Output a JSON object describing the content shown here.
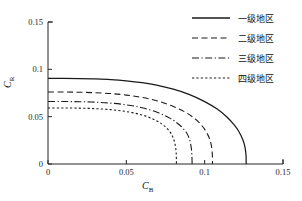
{
  "chart_data": {
    "type": "line",
    "title": "",
    "xlabel": "C_B",
    "xlabel_base": "C",
    "xlabel_sub": "B",
    "ylabel_base": "C",
    "ylabel_sub": "R",
    "xlim": [
      0,
      0.15
    ],
    "ylim": [
      0,
      0.15
    ],
    "xticks": [
      0,
      0.05,
      0.1,
      0.15
    ],
    "xticklabels": [
      "0",
      "0.05",
      "0.1",
      "0.15"
    ],
    "yticks": [
      0,
      0.05,
      0.1,
      0.15
    ],
    "yticklabels": [
      "0",
      "0.05",
      "0.1",
      "0.15"
    ],
    "grid": false,
    "legend_position": "top-right",
    "series": [
      {
        "name": "一级地区",
        "style": "solid",
        "color": "#1a1a1a",
        "y_intercept": 0.0905,
        "x_intercept": 0.1265,
        "exponent": 4.0,
        "points": [
          [
            0.0,
            0.0905
          ],
          [
            0.01,
            0.0905
          ],
          [
            0.02,
            0.0903
          ],
          [
            0.03,
            0.0899
          ],
          [
            0.04,
            0.0892
          ],
          [
            0.05,
            0.0879
          ],
          [
            0.06,
            0.0859
          ],
          [
            0.07,
            0.083
          ],
          [
            0.08,
            0.079
          ],
          [
            0.09,
            0.0735
          ],
          [
            0.1,
            0.0659
          ],
          [
            0.108,
            0.058
          ],
          [
            0.114,
            0.0499
          ],
          [
            0.119,
            0.0411
          ],
          [
            0.122,
            0.0338
          ],
          [
            0.1245,
            0.0251
          ],
          [
            0.1258,
            0.0173
          ],
          [
            0.1264,
            0.0092
          ],
          [
            0.1265,
            0.0
          ]
        ]
      },
      {
        "name": "二级地区",
        "style": "dashed",
        "color": "#1a1a1a",
        "y_intercept": 0.076,
        "x_intercept": 0.105,
        "exponent": 4.0,
        "points": [
          [
            0.0,
            0.076
          ],
          [
            0.01,
            0.076
          ],
          [
            0.02,
            0.0758
          ],
          [
            0.03,
            0.0753
          ],
          [
            0.04,
            0.0744
          ],
          [
            0.05,
            0.0728
          ],
          [
            0.06,
            0.0703
          ],
          [
            0.07,
            0.0665
          ],
          [
            0.08,
            0.0607
          ],
          [
            0.088,
            0.0544
          ],
          [
            0.094,
            0.0475
          ],
          [
            0.098,
            0.041
          ],
          [
            0.101,
            0.034
          ],
          [
            0.1032,
            0.0263
          ],
          [
            0.1044,
            0.0182
          ],
          [
            0.1049,
            0.0096
          ],
          [
            0.105,
            0.0
          ]
        ]
      },
      {
        "name": "三级地区",
        "style": "dashdot",
        "color": "#1a1a1a",
        "y_intercept": 0.066,
        "x_intercept": 0.092,
        "exponent": 4.0,
        "points": [
          [
            0.0,
            0.066
          ],
          [
            0.01,
            0.066
          ],
          [
            0.02,
            0.0658
          ],
          [
            0.03,
            0.0653
          ],
          [
            0.04,
            0.0643
          ],
          [
            0.05,
            0.0625
          ],
          [
            0.06,
            0.0594
          ],
          [
            0.07,
            0.0544
          ],
          [
            0.078,
            0.0482
          ],
          [
            0.084,
            0.0412
          ],
          [
            0.088,
            0.0341
          ],
          [
            0.09,
            0.0278
          ],
          [
            0.091,
            0.0212
          ],
          [
            0.0917,
            0.0135
          ],
          [
            0.092,
            0.0
          ]
        ]
      },
      {
        "name": "四级地区",
        "style": "dotted",
        "color": "#1a1a1a",
        "y_intercept": 0.0592,
        "x_intercept": 0.082,
        "exponent": 4.0,
        "points": [
          [
            0.0,
            0.0592
          ],
          [
            0.01,
            0.0592
          ],
          [
            0.02,
            0.059
          ],
          [
            0.03,
            0.0585
          ],
          [
            0.04,
            0.0574
          ],
          [
            0.05,
            0.0554
          ],
          [
            0.06,
            0.0518
          ],
          [
            0.068,
            0.0468
          ],
          [
            0.074,
            0.0406
          ],
          [
            0.078,
            0.0336
          ],
          [
            0.08,
            0.0273
          ],
          [
            0.0812,
            0.0202
          ],
          [
            0.0818,
            0.0122
          ],
          [
            0.082,
            0.0
          ]
        ]
      }
    ]
  },
  "legend": {
    "items": [
      {
        "label": "一级地区",
        "style": "solid"
      },
      {
        "label": "二级地区",
        "style": "dashed"
      },
      {
        "label": "三级地区",
        "style": "dashdot"
      },
      {
        "label": "四级地区",
        "style": "dotted"
      }
    ]
  }
}
